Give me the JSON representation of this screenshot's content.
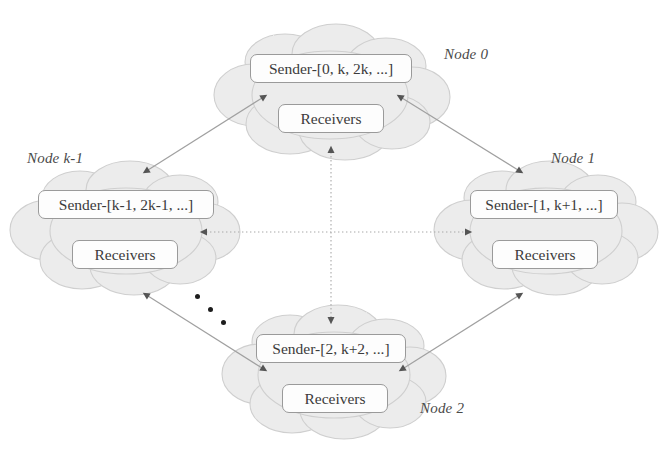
{
  "figure": {
    "type": "network-topology-diagram",
    "background_color": "#ffffff",
    "cloud_fill": "#ececec",
    "cloud_stroke": "#c8c8c8",
    "box_fill": "#fdfdfd",
    "box_stroke": "#9a9a9a",
    "arrow_color": "#8c8c8c",
    "arrowhead_color": "#555555",
    "text_color": "#3b3b3b"
  },
  "nodes": [
    {
      "id": "node-0",
      "label": "Node 0",
      "sender": "Sender-[0, k, 2k, ...]",
      "receivers": "Receivers",
      "cloud": {
        "cx": 330,
        "cy": 96,
        "rx": 104,
        "ry": 62
      },
      "label_pos": {
        "x": 444,
        "y": 46
      },
      "sender_box": {
        "x": 250,
        "y": 54,
        "w": 162,
        "h": 29
      },
      "receivers_box": {
        "x": 278,
        "y": 104,
        "w": 106,
        "h": 29
      }
    },
    {
      "id": "node-1",
      "label": "Node 1",
      "sender": "Sender-[1, k+1, ...]",
      "receivers": "Receivers",
      "cloud": {
        "cx": 544,
        "cy": 232,
        "rx": 100,
        "ry": 62
      },
      "label_pos": {
        "x": 551,
        "y": 150
      },
      "sender_box": {
        "x": 470,
        "y": 190,
        "w": 148,
        "h": 29
      },
      "receivers_box": {
        "x": 492,
        "y": 240,
        "w": 106,
        "h": 29
      }
    },
    {
      "id": "node-2",
      "label": "Node 2",
      "sender": "Sender-[2, k+2, ...]",
      "receivers": "Receivers",
      "cloud": {
        "cx": 332,
        "cy": 376,
        "rx": 100,
        "ry": 62
      },
      "label_pos": {
        "x": 420,
        "y": 400
      },
      "sender_box": {
        "x": 256,
        "y": 334,
        "w": 150,
        "h": 29
      },
      "receivers_box": {
        "x": 282,
        "y": 384,
        "w": 106,
        "h": 29
      }
    },
    {
      "id": "node-k-1",
      "label": "Node k-1",
      "sender": "Sender-[k-1, 2k-1, ...]",
      "receivers": "Receivers",
      "cloud": {
        "cx": 124,
        "cy": 232,
        "rx": 104,
        "ry": 62
      },
      "label_pos": {
        "x": 27,
        "y": 150
      },
      "sender_box": {
        "x": 38,
        "y": 190,
        "w": 176,
        "h": 29
      },
      "receivers_box": {
        "x": 72,
        "y": 240,
        "w": 106,
        "h": 29
      }
    }
  ],
  "links": [
    {
      "id": "link-k1-to-0",
      "from": "node-k-1",
      "to": "node-0",
      "style": "solid",
      "arrows": "both"
    },
    {
      "id": "link-0-to-1",
      "from": "node-0",
      "to": "node-1",
      "style": "solid",
      "arrows": "both"
    },
    {
      "id": "link-1-to-2",
      "from": "node-1",
      "to": "node-2",
      "style": "solid",
      "arrows": "both"
    },
    {
      "id": "link-k1-to-2",
      "from": "node-k-1",
      "to": "node-2",
      "style": "solid",
      "arrows": "both"
    },
    {
      "id": "link-0-to-2-vertical",
      "from": "node-0",
      "to": "node-2",
      "style": "dotted",
      "arrows": "both"
    },
    {
      "id": "link-k1-to-1-horizontal",
      "from": "node-k-1",
      "to": "node-1",
      "style": "dotted",
      "arrows": "both"
    }
  ],
  "ellipsis": {
    "name": "more-nodes-ellipsis",
    "dots": [
      {
        "x": 195,
        "y": 294
      },
      {
        "x": 208,
        "y": 307
      },
      {
        "x": 221,
        "y": 320
      }
    ]
  }
}
